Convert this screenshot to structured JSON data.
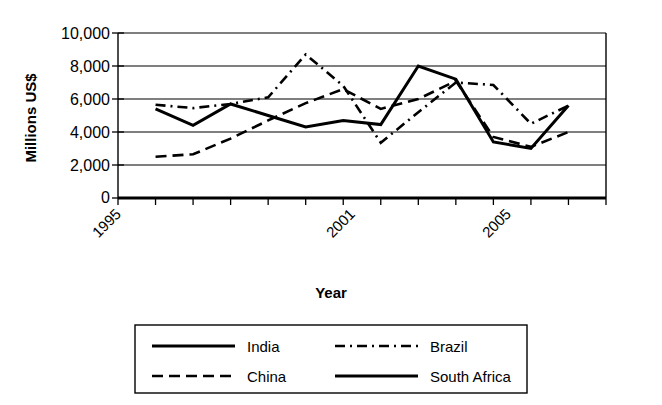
{
  "chart_data": {
    "type": "line",
    "title": "",
    "xlabel": "Year",
    "ylabel": "Millions US$",
    "ylim": [
      0,
      10000
    ],
    "ytick_labels": [
      "10,000",
      "8,000",
      "6,000",
      "4,000",
      "2,000",
      "0"
    ],
    "ytick_values": [
      10000,
      8000,
      6000,
      4000,
      2000,
      0
    ],
    "xlim": [
      1995,
      2008
    ],
    "xtick_values": [
      1995,
      1996,
      1997,
      1998,
      1999,
      2000,
      2001,
      2002,
      2003,
      2004,
      2005,
      2006,
      2007,
      2008
    ],
    "xtick_labels_shown": [
      "1995",
      "2001",
      "2005"
    ],
    "x": [
      1996,
      1997,
      1998,
      1999,
      2000,
      2001,
      2002,
      2003,
      2004,
      2005,
      2006,
      2007
    ],
    "grid": true,
    "legend_position": "bottom",
    "series": [
      {
        "name": "India",
        "style": "solid",
        "values": [
          5400,
          4400,
          5700,
          5000,
          4300,
          4700,
          4450,
          8000,
          7200,
          3400,
          3000,
          5600
        ]
      },
      {
        "name": "China",
        "style": "dashed",
        "values": [
          2500,
          2650,
          3600,
          4700,
          5750,
          6600,
          5400,
          6000,
          7100,
          3700,
          3100,
          4000
        ]
      },
      {
        "name": "Brazil",
        "style": "dash-dot",
        "values": [
          5650,
          5450,
          5700,
          6100,
          8700,
          6800,
          3350,
          5200,
          7000,
          6850,
          4500,
          5600
        ]
      },
      {
        "name": "South Africa",
        "style": "solid",
        "values": [
          5400,
          4400,
          5700,
          5000,
          4300,
          4700,
          4450,
          8000,
          7200,
          3400,
          3000,
          5600
        ]
      }
    ]
  },
  "axes": {
    "y_title": "Millions US$",
    "x_title": "Year",
    "y_labels": [
      "10,000",
      "8,000",
      "6,000",
      "4,000",
      "2,000",
      "0"
    ],
    "x_labels": [
      "1995",
      "2001",
      "2005"
    ]
  },
  "legend": {
    "entries": [
      {
        "label": "India",
        "style": "solid"
      },
      {
        "label": "Brazil",
        "style": "dash-dot"
      },
      {
        "label": "China",
        "style": "dashed"
      },
      {
        "label": "South Africa",
        "style": "solid"
      }
    ]
  },
  "colors": {
    "ink": "#000000",
    "paper": "#ffffff"
  }
}
